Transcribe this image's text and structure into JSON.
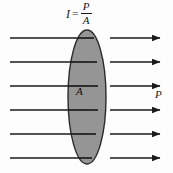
{
  "figure": {
    "title_formula": {
      "symbol": "I",
      "equals": "=",
      "numerator": "P",
      "denominator": "A"
    },
    "labels": {
      "area": "A",
      "power": "P"
    },
    "colors": {
      "background": "#fdfdfd",
      "ellipse_fill": "#8c8c8c",
      "ellipse_stroke": "#2b2b2b",
      "ray_stroke": "#1a1a1a",
      "text": "#1a1a1a"
    },
    "geometry": {
      "ellipse": {
        "cx": 87,
        "cy": 97,
        "rx": 19,
        "ry": 67
      },
      "incoming_rays_x": {
        "start": 10,
        "end": 92
      },
      "outgoing_rays_x": {
        "start": 110,
        "end": 160
      },
      "ray_y_positions": [
        38,
        62,
        86,
        110,
        134,
        158
      ]
    }
  }
}
